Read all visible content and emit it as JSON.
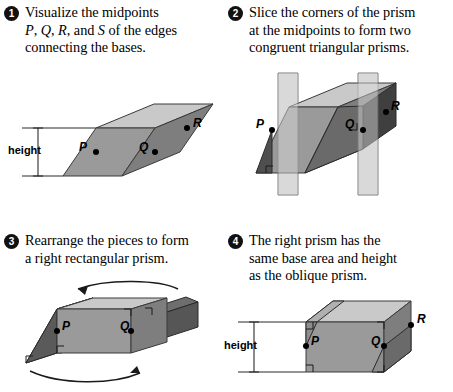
{
  "figure": {
    "background_color": "#ffffff"
  },
  "colors": {
    "top_face": "#c9c9c9",
    "front_face": "#9a9a9a",
    "side_face": "#7e7e7e",
    "wedge_dark": "#585858",
    "plane_translucent": "#d2d2d2",
    "outline": "#3a3a3a",
    "text": "#000000",
    "bullet_fill": "#111111",
    "bullet_text": "#ffffff"
  },
  "steps": [
    {
      "number": "1",
      "bullet_glyph": "1",
      "text": "Visualize the midpoints P, Q, R, and S of the edges connecting the bases.",
      "lines": [
        {
          "segments": [
            {
              "t": "Visualize the midpoints",
              "i": false
            }
          ]
        },
        {
          "segments": [
            {
              "t": "P",
              "i": true
            },
            {
              "t": ", ",
              "i": false
            },
            {
              "t": "Q",
              "i": true
            },
            {
              "t": ", ",
              "i": false
            },
            {
              "t": "R",
              "i": true
            },
            {
              "t": ", and ",
              "i": false
            },
            {
              "t": "S",
              "i": true
            },
            {
              "t": " of the edges",
              "i": false
            }
          ]
        },
        {
          "segments": [
            {
              "t": "connecting the bases.",
              "i": false
            }
          ]
        }
      ]
    },
    {
      "number": "2",
      "bullet_glyph": "2",
      "text": "Slice the corners of the prism at the midpoints to form two congruent triangular prisms.",
      "lines": [
        {
          "segments": [
            {
              "t": "Slice the corners of the prism",
              "i": false
            }
          ]
        },
        {
          "segments": [
            {
              "t": "at the midpoints to form two",
              "i": false
            }
          ]
        },
        {
          "segments": [
            {
              "t": "congruent triangular prisms.",
              "i": false
            }
          ]
        }
      ]
    },
    {
      "number": "3",
      "bullet_glyph": "3",
      "text": "Rearrange the pieces to form a right rectangular prism.",
      "lines": [
        {
          "segments": [
            {
              "t": "Rearrange the pieces to form",
              "i": false
            }
          ]
        },
        {
          "segments": [
            {
              "t": "a right rectangular prism.",
              "i": false
            }
          ]
        }
      ]
    },
    {
      "number": "4",
      "bullet_glyph": "4",
      "text": "The right prism has the same base area and height as the oblique prism.",
      "lines": [
        {
          "segments": [
            {
              "t": "The right prism has the",
              "i": false
            }
          ]
        },
        {
          "segments": [
            {
              "t": "same base area and height",
              "i": false
            }
          ]
        },
        {
          "segments": [
            {
              "t": "as the oblique prism.",
              "i": false
            }
          ]
        }
      ]
    }
  ],
  "diagram1": {
    "name": "oblique-prism-with-midpoints",
    "height_label": "height",
    "point_labels": {
      "p": "P",
      "q": "Q",
      "r": "R"
    }
  },
  "diagram2": {
    "name": "oblique-prism-sliced-by-planes",
    "point_labels": {
      "p": "P",
      "q": "Q",
      "r": "R"
    }
  },
  "diagram3": {
    "name": "rearranged-right-prism-with-rotation-arrows",
    "point_labels": {
      "p": "P",
      "q": "Q"
    }
  },
  "diagram4": {
    "name": "right-rectangular-prism-with-height",
    "height_label": "height",
    "point_labels": {
      "p": "P",
      "q": "Q",
      "r": "R"
    }
  }
}
